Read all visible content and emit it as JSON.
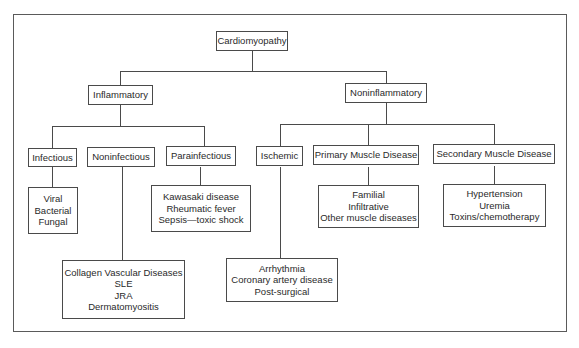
{
  "diagram": {
    "root": {
      "label": "Cardiomyopathy"
    },
    "level1": [
      {
        "label": "Inflammatory"
      },
      {
        "label": "Noninflammatory"
      }
    ],
    "inflammatory_children": [
      {
        "label": "Infectious",
        "examples": [
          "Viral",
          "Bacterial",
          "Fungal"
        ]
      },
      {
        "label": "Noninfectious",
        "examples": [
          "Collagen Vascular Diseases",
          "SLE",
          "JRA",
          "Dermatomyositis"
        ]
      },
      {
        "label": "Parainfectious",
        "examples": [
          "Kawasaki disease",
          "Rheumatic fever",
          "Sepsis—toxic shock"
        ]
      }
    ],
    "noninflammatory_children": [
      {
        "label": "Ischemic",
        "examples": [
          "Arrhythmia",
          "Coronary artery disease",
          "Post-surgical"
        ]
      },
      {
        "label": "Primary Muscle Disease",
        "examples": [
          "Familial",
          "Infiltrative",
          "Other muscle diseases"
        ]
      },
      {
        "label": "Secondary Muscle Disease",
        "examples": [
          "Hypertension",
          "Uremia",
          "Toxins/chemotherapy"
        ]
      }
    ]
  },
  "colors": {
    "line": "#4a4a4a",
    "text": "#2a2a2a",
    "background": "#ffffff"
  }
}
